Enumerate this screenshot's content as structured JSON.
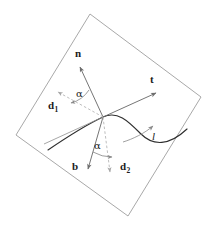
{
  "figure": {
    "kind": "geometry-diagram",
    "background_color": "#ffffff",
    "plane": {
      "name": "tangent-plane",
      "stroke_color": "#9a9a9a",
      "stroke_width": 0.9,
      "fill": "none",
      "corners": [
        {
          "x": 90,
          "y": 14
        },
        {
          "x": 201,
          "y": 97
        },
        {
          "x": 128,
          "y": 216
        },
        {
          "x": 16,
          "y": 135
        }
      ]
    },
    "origin": {
      "x": 103,
      "y": 117
    },
    "curve": {
      "name": "space-curve",
      "label": "l",
      "stroke_color": "#2b2b2b",
      "stroke_width": 1.1,
      "path": "M 48 150 C 70 135, 88 124, 103 117 C 118 110, 128 121, 140 133 C 152 145, 168 147, 186 131"
    },
    "vectors": [
      {
        "name": "normal-vector",
        "label": "n",
        "style": "solid",
        "stroke_color": "#6e6e6e",
        "tip": {
          "x": 79,
          "y": 66
        },
        "label_pos": {
          "x": 74,
          "y": 48
        }
      },
      {
        "name": "tangent-vector",
        "label": "t",
        "style": "solid",
        "stroke_color": "#6e6e6e",
        "tip": {
          "x": 157,
          "y": 92
        },
        "label_pos": {
          "x": 151,
          "y": 75
        }
      },
      {
        "name": "binormal-vector",
        "label": "b",
        "style": "solid",
        "stroke_color": "#6e6e6e",
        "tip": {
          "x": 88,
          "y": 172
        },
        "label_pos": {
          "x": 73,
          "y": 161
        }
      },
      {
        "name": "director-vector-d1",
        "label": "d",
        "sub": "1",
        "style": "dashed",
        "stroke_color": "#b4b4b4",
        "tip": {
          "x": 56,
          "y": 91
        },
        "label_pos": {
          "x": 50,
          "y": 103
        }
      },
      {
        "name": "director-vector-d2",
        "label": "d",
        "sub": "2",
        "style": "dashed",
        "stroke_color": "#b4b4b4",
        "tip": {
          "x": 110,
          "y": 175
        },
        "label_pos": {
          "x": 122,
          "y": 162
        }
      }
    ],
    "angles": [
      {
        "name": "angle-alpha-upper",
        "label": "α",
        "between": [
          "normal-vector",
          "director-vector-d1"
        ],
        "label_pos": {
          "x": 77,
          "y": 91
        },
        "arc_radius": 30,
        "stroke_color": "#8a8a8a"
      },
      {
        "name": "angle-alpha-lower",
        "label": "α",
        "between": [
          "binormal-vector",
          "director-vector-d2"
        ],
        "label_pos": {
          "x": 95,
          "y": 142
        },
        "arc_radius": 36,
        "stroke_color": "#8a8a8a"
      }
    ],
    "curve_label": {
      "name": "curve-label-l",
      "text": "l",
      "pos": {
        "x": 153,
        "y": 134
      },
      "direction_arrow": {
        "stroke_color": "#8a8a8a",
        "path": "M 124 141 C 134 137, 146 131, 154 124"
      }
    }
  }
}
